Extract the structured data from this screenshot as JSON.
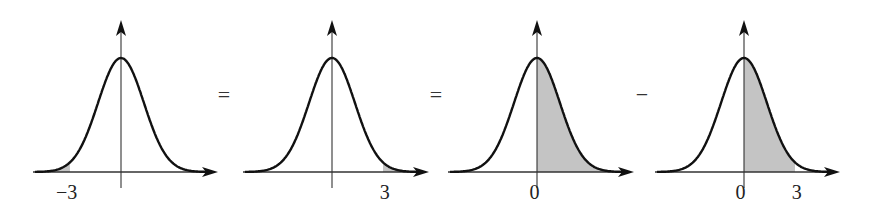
{
  "diagram": {
    "colors": {
      "curve": "#111111",
      "axis": "#333333",
      "shade": "#c4c4c4"
    },
    "operators": [
      "=",
      "=",
      "−"
    ],
    "panels": [
      {
        "id": "p1",
        "label": "−3",
        "shade": "left-tail",
        "shade_from": null,
        "shade_to": -3
      },
      {
        "id": "p2",
        "label": "3",
        "shade": "right-tail",
        "shade_from": 3,
        "shade_to": null
      },
      {
        "id": "p3",
        "label": "0",
        "shade": "right-half",
        "shade_from": 0,
        "shade_to": null
      },
      {
        "id": "p4",
        "labels": [
          "0",
          "3"
        ],
        "shade": "between",
        "shade_from": 0,
        "shade_to": 3
      }
    ]
  }
}
